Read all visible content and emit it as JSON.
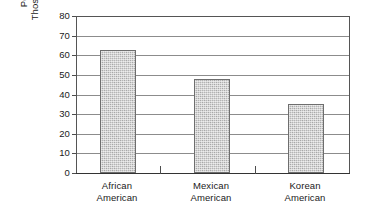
{
  "chart_data": {
    "type": "bar",
    "title": "",
    "subtitle": "",
    "xlabel": "",
    "ylabel_lines": [
      "Percent of",
      "Those Surveyed"
    ],
    "ylabel": "Percent of Those Surveyed",
    "categories": [
      "African American",
      "Mexican American",
      "Korean American"
    ],
    "category_lines": [
      [
        "African",
        "American"
      ],
      [
        "Mexican",
        "American"
      ],
      [
        "Korean",
        "American"
      ]
    ],
    "values": [
      63,
      48,
      35.5
    ],
    "ylim": [
      0,
      80
    ],
    "ytick_step": 10,
    "yticks": [
      80,
      70,
      60,
      50,
      40,
      30,
      20,
      10,
      0
    ],
    "grid": true,
    "grid_axis": "y",
    "legend": null,
    "legend_position": "none",
    "bar_fill_color": "#b5b5b5",
    "bar_border_color": "#6e6e6e",
    "gridline_color": "#8c8c8c",
    "frame_color": "#555555",
    "background_color": "#ffffff",
    "text_color": "#1a1a1a"
  }
}
